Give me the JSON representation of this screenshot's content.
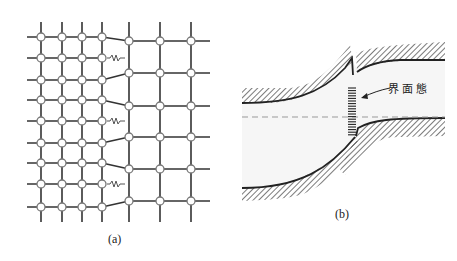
{
  "figure": {
    "panel_a": {
      "caption": "(a)",
      "left_lattice": {
        "columns_x": [
          41,
          62,
          82,
          102
        ],
        "rows_y": [
          37,
          58,
          80,
          100,
          121,
          143,
          163,
          184,
          207
        ],
        "dangling_bond_rows": [
          1,
          4,
          7
        ]
      },
      "right_lattice": {
        "columns_x": [
          129,
          160,
          191
        ],
        "rows_y": [
          41,
          73,
          106,
          137,
          169,
          201
        ]
      }
    },
    "panel_b": {
      "caption": "(b)",
      "label": "界面態"
    },
    "colors": {
      "line": "#333333",
      "node_fill": "#ffffff",
      "node_stroke": "#777777",
      "bond_spring": "#555555",
      "dash": "#999999",
      "band_fill": "#f4f4f4"
    }
  }
}
